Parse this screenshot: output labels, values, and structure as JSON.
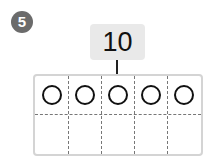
{
  "problem": {
    "number": "5",
    "target_value": "10"
  },
  "ten_frame": {
    "columns": 5,
    "rows": 2,
    "top_row_counters": 5,
    "bottom_row_counters": 0
  },
  "colors": {
    "badge": "#6b6b6b",
    "tag_background": "#e9e9e9",
    "frame_border": "#d4d4d4",
    "dashed_line": "#777777",
    "counter_stroke": "#111111"
  }
}
